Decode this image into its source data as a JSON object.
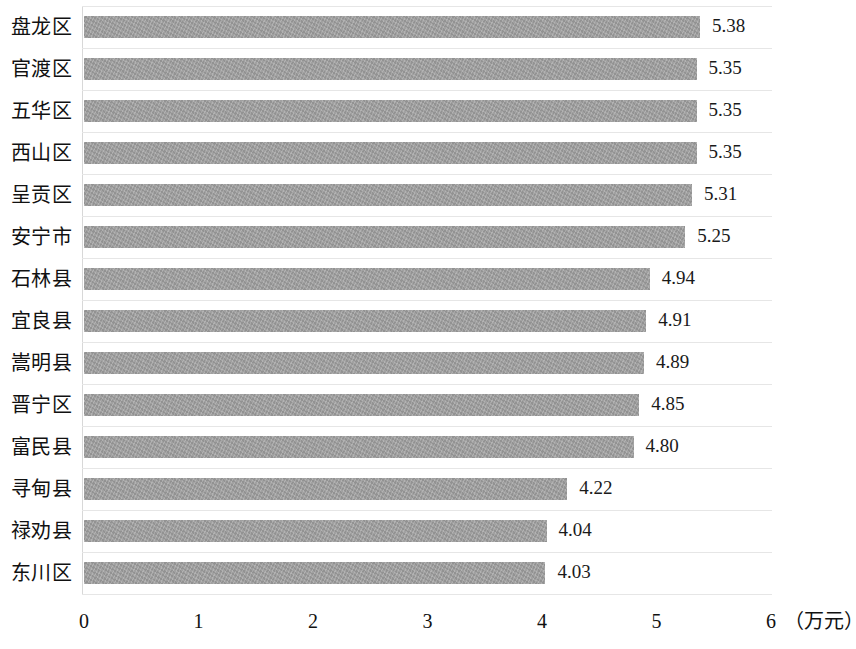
{
  "chart_data": {
    "type": "bar",
    "orientation": "horizontal",
    "title": "",
    "xlabel": "（万元）",
    "ylabel": "",
    "xlim": [
      0,
      6
    ],
    "xticks": [
      "0",
      "1",
      "2",
      "3",
      "4",
      "5",
      "6"
    ],
    "grid": "horizontal",
    "legend": "none",
    "bar_color": "#9e9e9e",
    "categories": [
      "盘龙区",
      "官渡区",
      "五华区",
      "西山区",
      "呈贡区",
      "安宁市",
      "石林县",
      "宜良县",
      "嵩明县",
      "晋宁区",
      "富民县",
      "寻甸县",
      "禄劝县",
      "东川区"
    ],
    "values": [
      5.38,
      5.35,
      5.35,
      5.35,
      5.31,
      5.25,
      4.94,
      4.91,
      4.89,
      4.85,
      4.8,
      4.22,
      4.04,
      4.03
    ],
    "value_labels": [
      "5.38",
      "5.35",
      "5.35",
      "5.35",
      "5.31",
      "5.25",
      "4.94",
      "4.91",
      "4.89",
      "4.85",
      "4.80",
      "4.22",
      "4.04",
      "4.03"
    ]
  }
}
